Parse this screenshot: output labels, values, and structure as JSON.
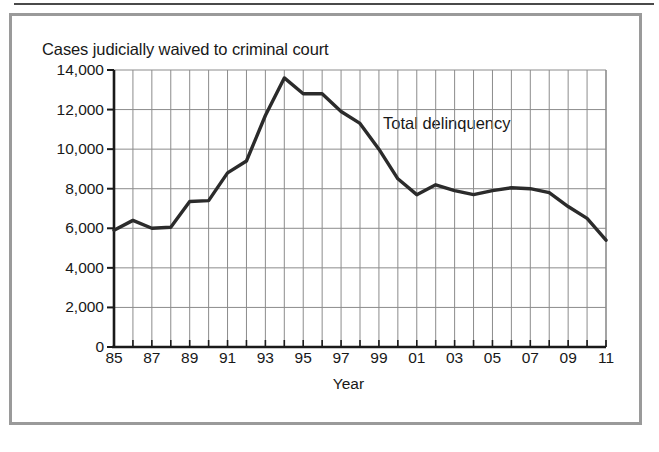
{
  "figure": {
    "title": "Cases judicially waived to criminal court",
    "series_annotation": "Total delinquency",
    "xlabel": "Year",
    "line_color": "#2b2b2b",
    "grid_color": "#8c8c8c",
    "axis_color": "#1a1a1a",
    "frame_color": "#9a9a9a"
  },
  "chart_data": {
    "type": "line",
    "title": "Cases judicially waived to criminal court",
    "xlabel": "Year",
    "ylabel": "",
    "ylim": [
      0,
      14000
    ],
    "xlim": [
      1985,
      2011
    ],
    "grid": true,
    "legend": "inline-annotation",
    "ytick_labels": [
      "14,000",
      "12,000",
      "10,000",
      "8,000",
      "6,000",
      "4,000",
      "2,000",
      "0"
    ],
    "ytick_values": [
      14000,
      12000,
      10000,
      8000,
      6000,
      4000,
      2000,
      0
    ],
    "xtick_labels": [
      "85",
      "87",
      "89",
      "91",
      "93",
      "95",
      "97",
      "99",
      "01",
      "03",
      "05",
      "07",
      "09",
      "11"
    ],
    "xtick_values": [
      1985,
      1987,
      1989,
      1991,
      1993,
      1995,
      1997,
      1999,
      2001,
      2003,
      2005,
      2007,
      2009,
      2011
    ],
    "x": [
      1985,
      1986,
      1987,
      1988,
      1989,
      1990,
      1991,
      1992,
      1993,
      1994,
      1995,
      1996,
      1997,
      1998,
      1999,
      2000,
      2001,
      2002,
      2003,
      2004,
      2005,
      2006,
      2007,
      2008,
      2009,
      2010,
      2011
    ],
    "series": [
      {
        "name": "Total delinquency",
        "values": [
          5900,
          6400,
          6000,
          6050,
          7350,
          7400,
          8800,
          9400,
          11700,
          13600,
          12800,
          12800,
          11900,
          11300,
          10000,
          8500,
          7700,
          8200,
          7900,
          7700,
          7900,
          8050,
          8000,
          7800,
          7100,
          6500,
          5400
        ]
      }
    ]
  }
}
